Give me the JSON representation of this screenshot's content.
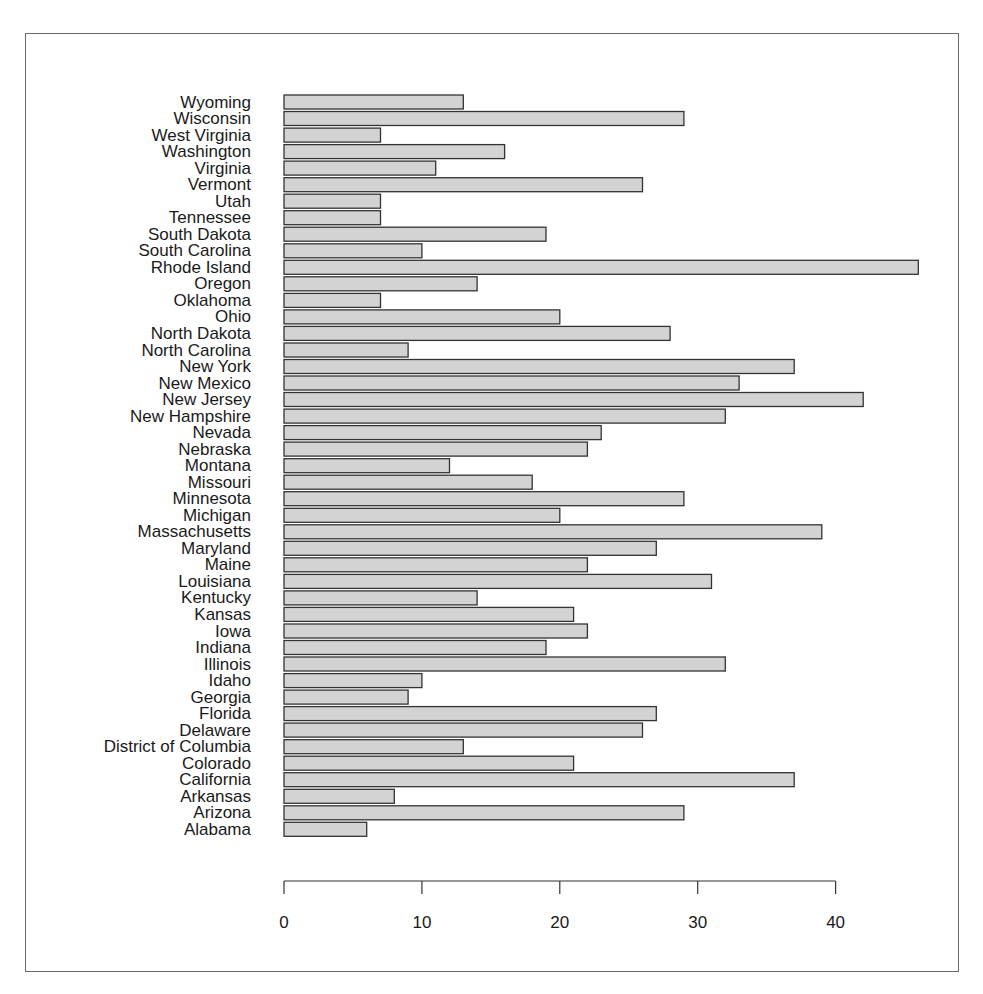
{
  "chart_data": {
    "type": "bar",
    "orientation": "horizontal",
    "title": "",
    "xlabel": "",
    "ylabel": "",
    "xlim": [
      0,
      46
    ],
    "x_ticks": [
      0,
      10,
      20,
      30,
      40
    ],
    "grid": false,
    "legend": null,
    "categories": [
      "Alabama",
      "Arizona",
      "Arkansas",
      "California",
      "Colorado",
      "District of Columbia",
      "Delaware",
      "Florida",
      "Georgia",
      "Idaho",
      "Illinois",
      "Indiana",
      "Iowa",
      "Kansas",
      "Kentucky",
      "Louisiana",
      "Maine",
      "Maryland",
      "Massachusetts",
      "Michigan",
      "Minnesota",
      "Missouri",
      "Montana",
      "Nebraska",
      "Nevada",
      "New Hampshire",
      "New Jersey",
      "New Mexico",
      "New York",
      "North Carolina",
      "North Dakota",
      "Ohio",
      "Oklahoma",
      "Oregon",
      "Rhode Island",
      "South Carolina",
      "South Dakota",
      "Tennessee",
      "Utah",
      "Vermont",
      "Virginia",
      "Washington",
      "West Virginia",
      "Wisconsin",
      "Wyoming"
    ],
    "values": [
      6,
      29,
      8,
      37,
      21,
      13,
      26,
      27,
      9,
      10,
      32,
      19,
      22,
      21,
      14,
      31,
      22,
      27,
      39,
      20,
      29,
      18,
      12,
      22,
      23,
      32,
      42,
      33,
      37,
      9,
      28,
      20,
      7,
      14,
      46,
      10,
      19,
      7,
      7,
      26,
      11,
      16,
      7,
      29,
      13
    ],
    "bar_fill": "#d3d3d3",
    "bar_stroke": "#333333"
  }
}
